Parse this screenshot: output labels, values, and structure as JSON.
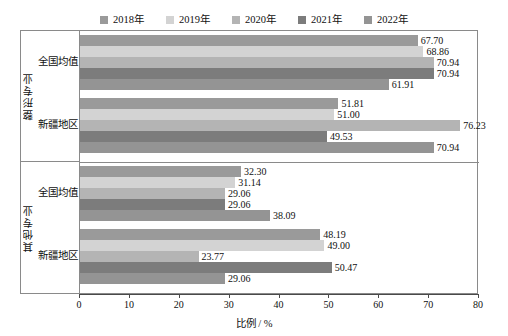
{
  "chart_data": {
    "type": "bar",
    "orientation": "horizontal",
    "title": "",
    "xlabel": "比例 / %",
    "ylabel": "",
    "xlim": [
      0,
      80
    ],
    "xticks": [
      0,
      10,
      20,
      30,
      40,
      50,
      60,
      70,
      80
    ],
    "grid": false,
    "legend_position": "top-center",
    "legend": [
      "2018年",
      "2019年",
      "2020年",
      "2021年",
      "2022年"
    ],
    "series_colors": [
      "#9a9a9a",
      "#d3d3d3",
      "#b4b4b4",
      "#7c7c7c",
      "#949494"
    ],
    "groups": [
      {
        "group_label": "整形专业",
        "categories": [
          "全国均值",
          "新疆地区"
        ],
        "rows": [
          {
            "category": "全国均值",
            "values": [
              67.7,
              68.86,
              70.94,
              70.94,
              61.91
            ],
            "labels": [
              "67.70",
              "68.86",
              "70.94",
              "70.94",
              "61.91"
            ]
          },
          {
            "category": "新疆地区",
            "values": [
              51.81,
              51.0,
              76.23,
              49.53,
              70.94
            ],
            "labels": [
              "51.81",
              "51.00",
              "76.23",
              "49.53",
              "70.94"
            ]
          }
        ]
      },
      {
        "group_label": "其他专业",
        "categories": [
          "全国均值",
          "新疆地区"
        ],
        "rows": [
          {
            "category": "全国均值",
            "values": [
              32.3,
              31.14,
              29.06,
              29.06,
              38.09
            ],
            "labels": [
              "32.30",
              "31.14",
              "29.06",
              "29.06",
              "38.09"
            ]
          },
          {
            "category": "新疆地区",
            "values": [
              48.19,
              49.0,
              23.77,
              50.47,
              29.06
            ],
            "labels": [
              "48.19",
              "49.00",
              "23.77",
              "50.47",
              "29.06"
            ]
          }
        ]
      }
    ]
  },
  "axis": {
    "x_tick_labels": [
      "0",
      "10",
      "20",
      "30",
      "40",
      "50",
      "60",
      "70",
      "80"
    ],
    "x_title": "比例 / %"
  },
  "legend": {
    "items": [
      {
        "label": "2018年",
        "color": "#9a9a9a"
      },
      {
        "label": "2019年",
        "color": "#d3d3d3"
      },
      {
        "label": "2020年",
        "color": "#b4b4b4"
      },
      {
        "label": "2021年",
        "color": "#7c7c7c"
      },
      {
        "label": "2022年",
        "color": "#949494"
      }
    ]
  },
  "gutter": {
    "group_labels": [
      "整形专业",
      "其他专业"
    ],
    "sub_labels": [
      "全国均值",
      "新疆地区",
      "全国均值",
      "新疆地区"
    ]
  }
}
